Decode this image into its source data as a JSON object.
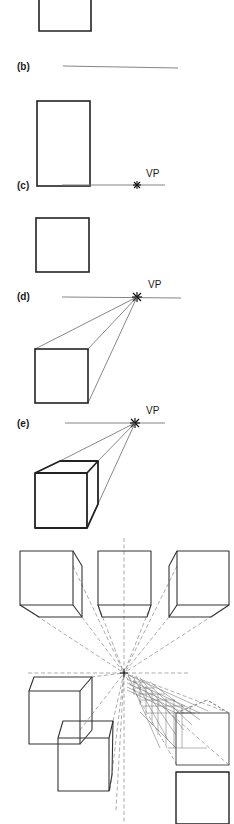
{
  "figure": {
    "steps": [
      {
        "id": "a",
        "label": "(a)",
        "visible_label": false,
        "description": "Front square (cropped at top)"
      },
      {
        "id": "b",
        "label": "(b)",
        "description": "Square with horizon line"
      },
      {
        "id": "c",
        "label": "(c)",
        "vp_label": "VP",
        "description": "Vanishing point placed on horizon"
      },
      {
        "id": "d",
        "label": "(d)",
        "vp_label": "VP",
        "description": "Corners of square connected to VP"
      },
      {
        "id": "e",
        "label": "(e)",
        "vp_label": "VP",
        "description": "Back edges drawn to form cube"
      }
    ],
    "bottom_panel": {
      "description": "Multiple cubes converging to a single central vanishing point, with a receding grid tunnel",
      "cube_count": 6,
      "guide_style": "dashed"
    },
    "colors": {
      "line": "#222222",
      "guide": "#888888",
      "background": "#ffffff"
    }
  }
}
